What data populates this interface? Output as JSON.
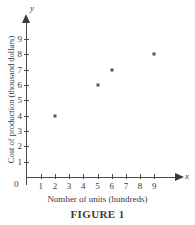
{
  "chart_data": {
    "type": "scatter",
    "title": "",
    "xlabel": "Number of units (hundreds)",
    "ylabel": "Cost of production (thousand dollars)",
    "x_var": "x",
    "y_var": "y",
    "origin_label": "0",
    "xlim": [
      0,
      9
    ],
    "ylim": [
      0,
      9
    ],
    "grid": false,
    "legend": null,
    "x_ticks": [
      "1",
      "2",
      "3",
      "4",
      "5",
      "6",
      "7",
      "8",
      "9"
    ],
    "y_ticks": [
      "1",
      "2",
      "3",
      "4",
      "5",
      "6",
      "7",
      "8",
      "9"
    ],
    "points": [
      {
        "x": 2,
        "y": 4
      },
      {
        "x": 5,
        "y": 6
      },
      {
        "x": 6,
        "y": 7
      },
      {
        "x": 9,
        "y": 8
      }
    ],
    "marker_color": "#555555",
    "axis_color": "#4a4a4a"
  },
  "caption": "FIGURE 1"
}
